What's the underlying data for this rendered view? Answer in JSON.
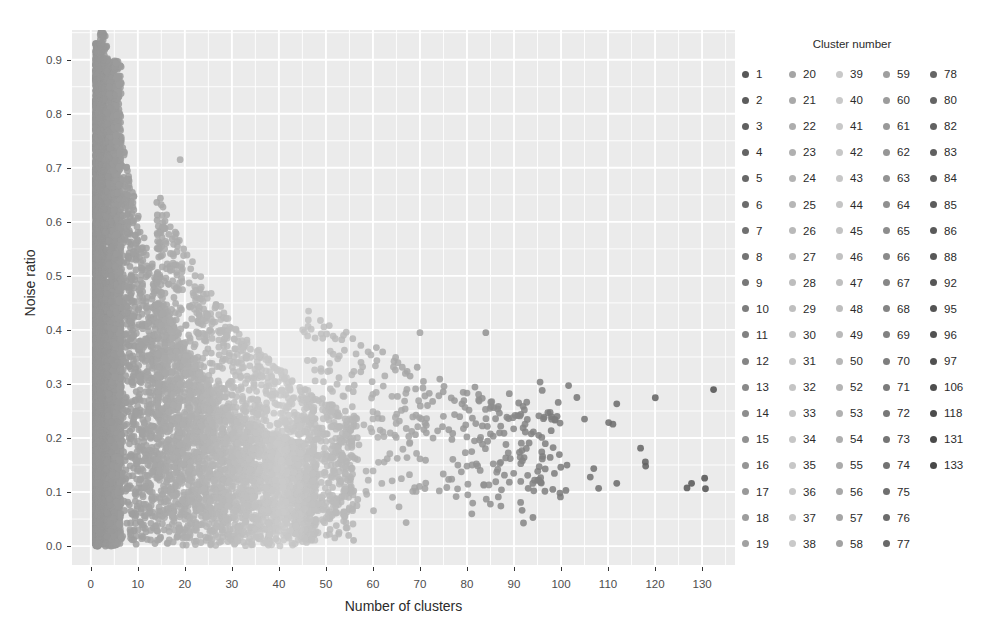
{
  "chart_data": {
    "type": "scatter",
    "title": "",
    "xlabel": "Number of clusters",
    "ylabel": "Noise ratio",
    "xlim": [
      -4,
      137
    ],
    "ylim": [
      -0.035,
      0.955
    ],
    "xticks": [
      0,
      10,
      20,
      30,
      40,
      50,
      60,
      70,
      80,
      90,
      100,
      110,
      120,
      130
    ],
    "yticks": [
      0.0,
      0.1,
      0.2,
      0.3,
      0.4,
      0.5,
      0.6,
      0.7,
      0.8,
      0.9
    ],
    "xtick_labels": [
      "0",
      "10",
      "20",
      "30",
      "40",
      "50",
      "60",
      "70",
      "80",
      "90",
      "100",
      "110",
      "120",
      "130"
    ],
    "ytick_labels": [
      "0.0",
      "0.1",
      "0.2",
      "0.3",
      "0.4",
      "0.5",
      "0.6",
      "0.7",
      "0.8",
      "0.9"
    ],
    "grid": true,
    "minor_grid": true,
    "panel_background": "#ebebeb",
    "grid_color": "#ffffff",
    "legend_position": "right",
    "legend_title": "Cluster number",
    "colormap": "viridis-grayscale",
    "point_color_dark": "#6e6e6e",
    "point_color_light": "#c8c8c8",
    "point_radius": 3.4,
    "point_opacity": 0.85,
    "notable_points": [
      {
        "x": 19,
        "y": 0.715
      },
      {
        "x": 70,
        "y": 0.395
      },
      {
        "x": 84,
        "y": 0.395
      },
      {
        "x": 105,
        "y": 0.235
      },
      {
        "x": 118,
        "y": 0.148
      },
      {
        "x": 96,
        "y": 0.288
      },
      {
        "x": 89,
        "y": 0.282
      },
      {
        "x": 82,
        "y": 0.152
      },
      {
        "x": 80,
        "y": 0.148
      }
    ],
    "series": [
      {
        "name": "all-points",
        "x": [
          0.6,
          0.7,
          0.8,
          0.9,
          1.0,
          1.1,
          1.2,
          1.3,
          1.4,
          1.5,
          1.6,
          1.7,
          1.8,
          1.9,
          2.0,
          2.1,
          2.2,
          2.3,
          2.4,
          2.5
        ],
        "y": [
          0.93,
          0.9,
          0.87,
          0.84,
          0.81,
          0.78,
          0.75,
          0.72,
          0.69,
          0.66,
          0.63,
          0.6,
          0.57,
          0.54,
          0.51,
          0.48,
          0.45,
          0.42,
          0.39,
          0.36
        ]
      }
    ]
  },
  "axes": {
    "x_title": "Number of clusters",
    "y_title": "Noise ratio"
  },
  "legend": {
    "title": "Cluster number",
    "columns": [
      {
        "items": [
          {
            "label": "1",
            "color": "#585858"
          },
          {
            "label": "2",
            "color": "#5c5c5c"
          },
          {
            "label": "3",
            "color": "#606060"
          },
          {
            "label": "4",
            "color": "#646464"
          },
          {
            "label": "5",
            "color": "#686868"
          },
          {
            "label": "6",
            "color": "#6c6c6c"
          },
          {
            "label": "7",
            "color": "#707070"
          },
          {
            "label": "8",
            "color": "#747474"
          },
          {
            "label": "9",
            "color": "#787878"
          },
          {
            "label": "10",
            "color": "#7d7d7d"
          },
          {
            "label": "11",
            "color": "#818181"
          },
          {
            "label": "12",
            "color": "#858585"
          },
          {
            "label": "13",
            "color": "#898989"
          },
          {
            "label": "14",
            "color": "#8d8d8d"
          },
          {
            "label": "15",
            "color": "#919191"
          },
          {
            "label": "16",
            "color": "#959595"
          },
          {
            "label": "17",
            "color": "#999999"
          },
          {
            "label": "18",
            "color": "#9d9d9d"
          },
          {
            "label": "19",
            "color": "#a1a1a1"
          }
        ]
      },
      {
        "items": [
          {
            "label": "20",
            "color": "#a5a5a5"
          },
          {
            "label": "21",
            "color": "#a9a9a9"
          },
          {
            "label": "22",
            "color": "#adadad"
          },
          {
            "label": "23",
            "color": "#b0b0b0"
          },
          {
            "label": "24",
            "color": "#b3b3b3"
          },
          {
            "label": "25",
            "color": "#b6b6b6"
          },
          {
            "label": "26",
            "color": "#b9b9b9"
          },
          {
            "label": "27",
            "color": "#bbbbbb"
          },
          {
            "label": "28",
            "color": "#bdbdbd"
          },
          {
            "label": "29",
            "color": "#bfbfbf"
          },
          {
            "label": "30",
            "color": "#c1c1c1"
          },
          {
            "label": "31",
            "color": "#c3c3c3"
          },
          {
            "label": "32",
            "color": "#c4c4c4"
          },
          {
            "label": "33",
            "color": "#c5c5c5"
          },
          {
            "label": "34",
            "color": "#c6c6c6"
          },
          {
            "label": "35",
            "color": "#c7c7c7"
          },
          {
            "label": "36",
            "color": "#c8c8c8"
          },
          {
            "label": "37",
            "color": "#c8c8c8"
          },
          {
            "label": "38",
            "color": "#c9c9c9"
          }
        ]
      },
      {
        "items": [
          {
            "label": "39",
            "color": "#c9c9c9"
          },
          {
            "label": "40",
            "color": "#c9c9c9"
          },
          {
            "label": "41",
            "color": "#c8c8c8"
          },
          {
            "label": "42",
            "color": "#c7c7c7"
          },
          {
            "label": "43",
            "color": "#c6c6c6"
          },
          {
            "label": "44",
            "color": "#c5c5c5"
          },
          {
            "label": "45",
            "color": "#c3c3c3"
          },
          {
            "label": "46",
            "color": "#c1c1c1"
          },
          {
            "label": "47",
            "color": "#bfbfbf"
          },
          {
            "label": "48",
            "color": "#bdbdbd"
          },
          {
            "label": "49",
            "color": "#bababa"
          },
          {
            "label": "50",
            "color": "#b7b7b7"
          },
          {
            "label": "52",
            "color": "#b4b4b4"
          },
          {
            "label": "53",
            "color": "#b1b1b1"
          },
          {
            "label": "54",
            "color": "#aeaeae"
          },
          {
            "label": "55",
            "color": "#ababab"
          },
          {
            "label": "56",
            "color": "#a8a8a8"
          },
          {
            "label": "57",
            "color": "#a5a5a5"
          },
          {
            "label": "58",
            "color": "#a2a2a2"
          }
        ]
      },
      {
        "items": [
          {
            "label": "59",
            "color": "#9f9f9f"
          },
          {
            "label": "60",
            "color": "#9c9c9c"
          },
          {
            "label": "61",
            "color": "#999999"
          },
          {
            "label": "62",
            "color": "#969696"
          },
          {
            "label": "63",
            "color": "#939393"
          },
          {
            "label": "64",
            "color": "#909090"
          },
          {
            "label": "65",
            "color": "#8d8d8d"
          },
          {
            "label": "66",
            "color": "#8a8a8a"
          },
          {
            "label": "67",
            "color": "#878787"
          },
          {
            "label": "68",
            "color": "#848484"
          },
          {
            "label": "69",
            "color": "#818181"
          },
          {
            "label": "70",
            "color": "#7e7e7e"
          },
          {
            "label": "71",
            "color": "#7b7b7b"
          },
          {
            "label": "72",
            "color": "#787878"
          },
          {
            "label": "73",
            "color": "#757575"
          },
          {
            "label": "74",
            "color": "#727272"
          },
          {
            "label": "75",
            "color": "#6f6f6f"
          },
          {
            "label": "76",
            "color": "#6c6c6c"
          },
          {
            "label": "77",
            "color": "#696969"
          }
        ]
      },
      {
        "items": [
          {
            "label": "78",
            "color": "#666666"
          },
          {
            "label": "80",
            "color": "#646464"
          },
          {
            "label": "82",
            "color": "#626262"
          },
          {
            "label": "83",
            "color": "#606060"
          },
          {
            "label": "84",
            "color": "#5e5e5e"
          },
          {
            "label": "85",
            "color": "#5c5c5c"
          },
          {
            "label": "86",
            "color": "#5a5a5a"
          },
          {
            "label": "88",
            "color": "#585858"
          },
          {
            "label": "92",
            "color": "#565656"
          },
          {
            "label": "95",
            "color": "#545454"
          },
          {
            "label": "96",
            "color": "#525252"
          },
          {
            "label": "97",
            "color": "#505050"
          },
          {
            "label": "106",
            "color": "#4e4e4e"
          },
          {
            "label": "118",
            "color": "#4c4c4c"
          },
          {
            "label": "131",
            "color": "#4a4a4a"
          },
          {
            "label": "133",
            "color": "#484848"
          }
        ]
      }
    ]
  }
}
